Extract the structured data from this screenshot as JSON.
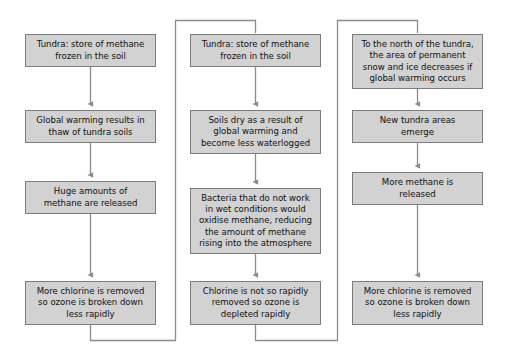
{
  "diagram": {
    "type": "flowchart",
    "colors": {
      "node_fill": "#d2d2d2",
      "node_border": "#7b7b7b",
      "connector": "#808080",
      "text": "#111111",
      "background": "#ffffff"
    },
    "columns": [
      {
        "id": "column-1",
        "name": "thaw-of-tundra-soils",
        "nodes": [
          {
            "id": "c1-n1",
            "name": "tundra-methane-store",
            "text": "Tundra: store of methane\nfrozen in the soil",
            "x": 25,
            "y": 34,
            "w": 131,
            "h": 33
          },
          {
            "id": "c1-n2",
            "name": "global-warming-thaw",
            "text": "Global warming results in\nthaw of tundra soils",
            "x": 25,
            "y": 110,
            "w": 131,
            "h": 33
          },
          {
            "id": "c1-n3",
            "name": "methane-released",
            "text": "Huge amounts of\nmethane are released",
            "x": 25,
            "y": 181,
            "w": 131,
            "h": 33
          },
          {
            "id": "c1-n4",
            "name": "chlorine-removed-ozone-slow",
            "text": "More chlorine is removed\nso ozone is broken down\nless rapidly",
            "x": 25,
            "y": 281,
            "w": 131,
            "h": 44
          }
        ]
      },
      {
        "id": "column-2",
        "name": "soils-dry-bacteria-oxidise",
        "nodes": [
          {
            "id": "c2-n1",
            "name": "tundra-methane-store",
            "text": "Tundra: store of methane\nfrozen in the soil",
            "x": 190,
            "y": 34,
            "w": 131,
            "h": 33
          },
          {
            "id": "c2-n2",
            "name": "soils-dry-waterlogged",
            "text": "Soils dry as a result of\nglobal warming and\nbecome less waterlogged",
            "x": 190,
            "y": 110,
            "w": 131,
            "h": 44
          },
          {
            "id": "c2-n3",
            "name": "bacteria-oxidise-methane",
            "text": "Bacteria that do not work\nin wet conditions would\noxidise methane, reducing\nthe amount of methane\nrising into the atmosphere",
            "x": 190,
            "y": 188,
            "w": 131,
            "h": 66
          },
          {
            "id": "c2-n4",
            "name": "chlorine-not-removed-ozone-depleted",
            "text": "Chlorine is not so rapidly\nremoved so ozone is\ndepleted rapidly",
            "x": 190,
            "y": 281,
            "w": 131,
            "h": 44
          }
        ]
      },
      {
        "id": "column-3",
        "name": "new-tundra-areas",
        "nodes": [
          {
            "id": "c3-n1",
            "name": "permanent-snow-ice-decreases",
            "text": "To the north of the tundra,\nthe area of permanent\nsnow and ice decreases if\nglobal warming occurs",
            "x": 352,
            "y": 34,
            "w": 131,
            "h": 55
          },
          {
            "id": "c3-n2",
            "name": "new-tundra-areas-emerge",
            "text": "New tundra areas\nemerge",
            "x": 352,
            "y": 110,
            "w": 131,
            "h": 33
          },
          {
            "id": "c3-n3",
            "name": "more-methane-released",
            "text": "More methane is\nreleased",
            "x": 352,
            "y": 172,
            "w": 131,
            "h": 33
          },
          {
            "id": "c3-n4",
            "name": "chlorine-removed-ozone-slow",
            "text": "More chlorine is removed\nso ozone is broken down\nless rapidly",
            "x": 352,
            "y": 281,
            "w": 131,
            "h": 44
          }
        ]
      }
    ],
    "connectors": [
      {
        "name": "c1-n1-to-c1-n2",
        "type": "arrow",
        "from": "c1-n1",
        "to": "c1-n2"
      },
      {
        "name": "c1-n2-to-c1-n3",
        "type": "arrow",
        "from": "c1-n2",
        "to": "c1-n3"
      },
      {
        "name": "c1-n3-to-c1-n4",
        "type": "arrow",
        "from": "c1-n3",
        "to": "c1-n4"
      },
      {
        "name": "c1-n4-loopback",
        "type": "elbow",
        "from": "c1-n4",
        "to": "c2-n1"
      },
      {
        "name": "c2-n1-to-c2-n2",
        "type": "arrow",
        "from": "c2-n1",
        "to": "c2-n2"
      },
      {
        "name": "c2-n2-to-c2-n3",
        "type": "arrow",
        "from": "c2-n2",
        "to": "c2-n3"
      },
      {
        "name": "c2-n3-to-c2-n4",
        "type": "arrow",
        "from": "c2-n3",
        "to": "c2-n4"
      },
      {
        "name": "c2-n4-loopback",
        "type": "elbow",
        "from": "c2-n4",
        "to": "c3-n1"
      },
      {
        "name": "c3-n1-to-c3-n2",
        "type": "arrow",
        "from": "c3-n1",
        "to": "c3-n2"
      },
      {
        "name": "c3-n2-to-c3-n3",
        "type": "arrow",
        "from": "c3-n2",
        "to": "c3-n3"
      },
      {
        "name": "c3-n3-to-c3-n4",
        "type": "arrow",
        "from": "c3-n3",
        "to": "c3-n4"
      }
    ]
  }
}
